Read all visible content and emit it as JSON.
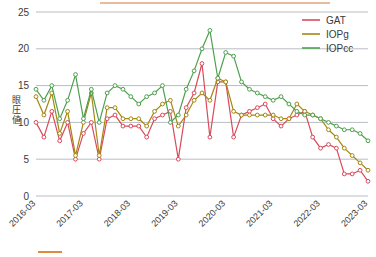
{
  "chart_data": {
    "type": "line",
    "title": "",
    "xlabel": "",
    "ylabel": "眼圧値",
    "ylim": [
      0,
      27
    ],
    "yticks": [
      0,
      5,
      10,
      15,
      20,
      25
    ],
    "ytick_labels": [
      "0",
      "5",
      "10",
      "15",
      "20",
      "25"
    ],
    "grid": true,
    "legend_position": "top-right",
    "xtick_labels": [
      "2016-03",
      "2017-03",
      "2018-03",
      "2019-03",
      "2020-03",
      "2021-03",
      "2022-03",
      "2023-03"
    ],
    "xtick_values": [
      0,
      6,
      12,
      18,
      24,
      30,
      36,
      42
    ],
    "x": [
      0,
      1,
      2,
      3,
      4,
      5,
      6,
      7,
      8,
      9,
      10,
      11,
      12,
      13,
      14,
      15,
      16,
      17,
      18,
      19,
      20,
      21,
      22,
      23,
      24,
      25,
      26,
      27,
      28,
      29,
      30,
      31,
      32,
      33,
      34,
      35,
      36,
      37,
      38,
      39,
      40,
      41,
      42
    ],
    "series": [
      {
        "name": "GAT",
        "color": "#d94a5c",
        "values": [
          10.0,
          8.0,
          11.5,
          7.5,
          10.0,
          5.0,
          8.5,
          10.0,
          5.0,
          10.5,
          11.0,
          9.5,
          9.5,
          9.5,
          8.0,
          10.5,
          11.0,
          11.5,
          5.0,
          12.0,
          14.0,
          18.0,
          8.0,
          15.5,
          15.5,
          8.0,
          11.0,
          11.5,
          12.0,
          12.5,
          10.5,
          9.5,
          10.5,
          11.0,
          11.5,
          8.0,
          6.5,
          7.0,
          6.5,
          3.0,
          3.0,
          3.5,
          2.0
        ]
      },
      {
        "name": "IOPg",
        "color": "#a4870f",
        "values": [
          13.5,
          11.0,
          14.0,
          8.5,
          11.5,
          5.5,
          10.0,
          14.0,
          5.5,
          12.0,
          12.0,
          10.5,
          10.5,
          10.5,
          9.5,
          11.5,
          12.5,
          13.0,
          9.5,
          11.0,
          13.0,
          14.0,
          13.0,
          16.0,
          15.5,
          11.5,
          11.0,
          11.0,
          11.0,
          11.0,
          11.0,
          10.5,
          10.5,
          12.5,
          11.5,
          11.0,
          10.5,
          9.0,
          8.0,
          6.5,
          5.5,
          4.5,
          3.5
        ]
      },
      {
        "name": "IOPcc",
        "color": "#4ea04e",
        "values": [
          14.5,
          13.0,
          15.0,
          10.5,
          13.0,
          16.5,
          10.5,
          14.5,
          10.0,
          14.0,
          15.0,
          14.5,
          13.5,
          12.5,
          13.5,
          14.0,
          15.0,
          10.0,
          11.0,
          14.5,
          17.0,
          20.0,
          22.5,
          16.0,
          19.5,
          19.0,
          15.5,
          14.5,
          14.0,
          13.5,
          13.0,
          13.5,
          12.5,
          11.5,
          11.0,
          11.0,
          10.5,
          10.0,
          9.5,
          9.0,
          9.0,
          8.5,
          7.5
        ]
      }
    ]
  },
  "legend": {
    "items": [
      {
        "label": "GAT",
        "color": "#d94a5c"
      },
      {
        "label": "IOPg",
        "color": "#a4870f"
      },
      {
        "label": "IOPcc",
        "color": "#4ea04e"
      }
    ]
  },
  "decor": {
    "top_rule_color": "#e0a578",
    "bottom_mark_color": "#e08a3c"
  }
}
